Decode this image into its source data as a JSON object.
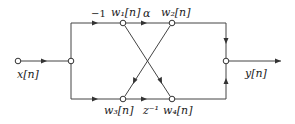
{
  "diagram": {
    "type": "signal-flow-graph",
    "input_label": "x[n]",
    "output_label": "y[n]",
    "nodes": {
      "w1": "w₁[n]",
      "w2": "w₂[n]",
      "w3": "w₃[n]",
      "w4": "w₄[n]"
    },
    "gains": {
      "top_input": "−1",
      "w1_to_w2": "α",
      "w3_to_w4": "z⁻¹"
    },
    "colors": {
      "line": "#444444",
      "node_fill": "#ffffff"
    }
  }
}
